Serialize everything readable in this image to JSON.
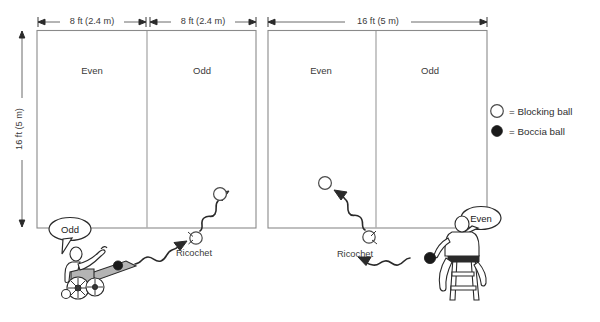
{
  "diagram": {
    "dimensions": {
      "left_half_a": "8 ft (2.4 m)",
      "left_half_b": "8 ft (2.4 m)",
      "right_full": "16 ft (5 m)",
      "vertical": "16 ft (5 m)"
    },
    "courts": [
      {
        "name": "left-court",
        "zones": [
          {
            "label": "Even"
          },
          {
            "label": "Odd"
          }
        ]
      },
      {
        "name": "right-court",
        "zones": [
          {
            "label": "Even"
          },
          {
            "label": "Odd"
          }
        ]
      }
    ],
    "annotations": {
      "ricochet_left": "Ricochet",
      "ricochet_right": "Ricochet",
      "bubble_left": "Odd",
      "bubble_right": "Even"
    },
    "legend": {
      "items": [
        {
          "symbol": "open-circle",
          "text": "= Blocking ball"
        },
        {
          "symbol": "filled-circle",
          "text": "= Boccia ball"
        }
      ]
    },
    "colors": {
      "line": "#8a8a8a",
      "text": "#3a3a3a",
      "ink": "#2a2a2a",
      "ramp": "#b4b4b4",
      "ball_fill": "#1a1a1a"
    }
  }
}
